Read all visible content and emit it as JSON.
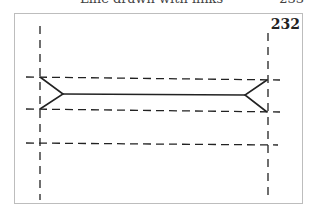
{
  "header": {
    "running_title": "Line drawn with links",
    "page_number": "233"
  },
  "figure": {
    "number": "232",
    "colors": {
      "line": "#222222",
      "frame": "#bdbdbd",
      "background": "#ffffff"
    },
    "vertical_guides": [
      {
        "x": 40,
        "y1": 26,
        "y2": 200
      },
      {
        "x": 268,
        "y1": 33,
        "y2": 196
      }
    ],
    "horizontal_guides": [
      {
        "x1": 26,
        "y1": 77,
        "x2": 280,
        "y2": 80
      },
      {
        "x1": 26,
        "y1": 109,
        "x2": 280,
        "y2": 112
      },
      {
        "x1": 26,
        "y1": 143,
        "x2": 278,
        "y2": 145
      }
    ],
    "solid_line": {
      "x1": 63,
      "y1": 94,
      "x2": 245,
      "y2": 95
    },
    "left_arrow": {
      "tip_top": [
        40,
        77
      ],
      "vertex": [
        63,
        94
      ],
      "tip_bottom": [
        40,
        109
      ]
    },
    "right_arrow": {
      "tip_top": [
        267,
        80
      ],
      "vertex": [
        245,
        95
      ],
      "tip_bottom": [
        267,
        112
      ]
    }
  }
}
